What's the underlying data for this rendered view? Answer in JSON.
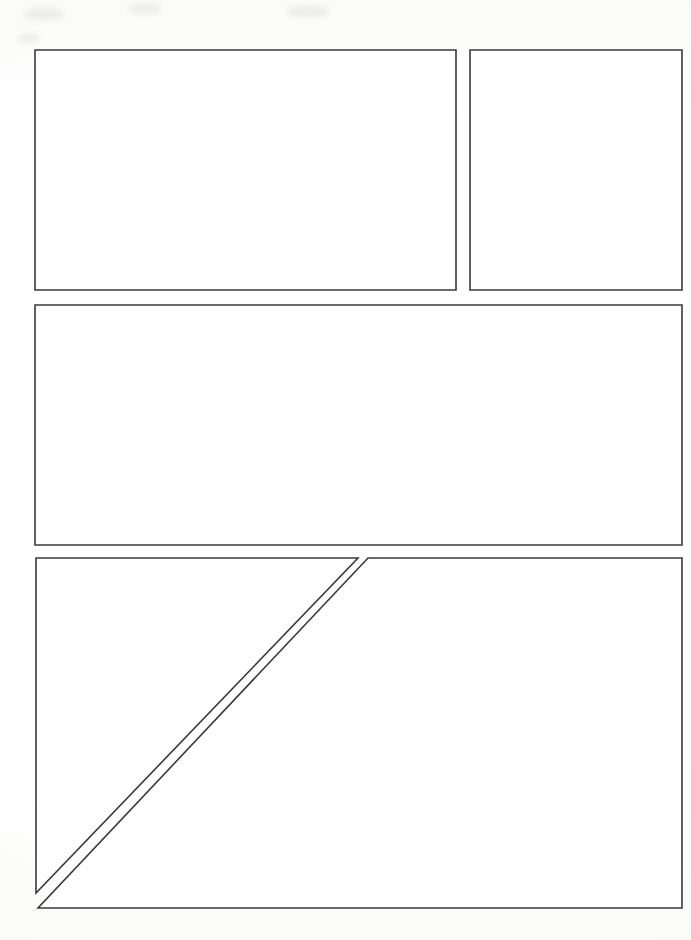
{
  "document": {
    "title": "Blank Comic Book Page Template",
    "page_width": 691,
    "page_height": 940,
    "background_color": "#fdfdfc",
    "panel_fill_color": "#ffffff",
    "panel_border_color": "#3a3a3c",
    "panel_border_width_px": 1.6,
    "panel_count": 5,
    "gutter_px": 14
  },
  "panels": [
    {
      "id": "panel-1",
      "label": "Panel 1",
      "row": 1,
      "shape": "rectangle",
      "x": 35,
      "y": 50,
      "width": 421,
      "height": 240,
      "content": ""
    },
    {
      "id": "panel-2",
      "label": "Panel 2",
      "row": 1,
      "shape": "rectangle",
      "x": 470,
      "y": 50,
      "width": 212,
      "height": 240,
      "content": ""
    },
    {
      "id": "panel-3",
      "label": "Panel 3",
      "row": 2,
      "shape": "rectangle",
      "x": 35,
      "y": 305,
      "width": 647,
      "height": 240,
      "content": ""
    },
    {
      "id": "panel-4",
      "label": "Panel 4",
      "row": 3,
      "shape": "triangle",
      "description": "upper-left triangular panel formed by the diagonal split",
      "points": "36,558 358,558 36,893",
      "content": ""
    },
    {
      "id": "panel-5",
      "label": "Panel 5",
      "row": 3,
      "shape": "triangle",
      "description": "lower-right triangular panel formed by the diagonal split",
      "points": "368,558 682,558 682,908 38,908",
      "content": ""
    }
  ],
  "diagonal_split": {
    "id": "diagonal-divider",
    "label": "Diagonal gutter",
    "from_x": 363,
    "from_y": 558,
    "to_x": 37,
    "to_y": 900,
    "gutter_px": 9
  }
}
